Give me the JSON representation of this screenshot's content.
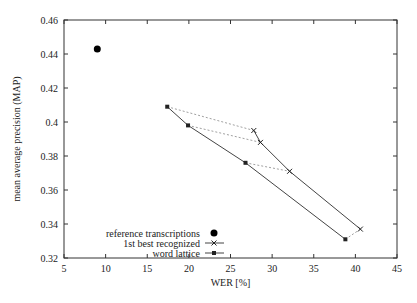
{
  "chart_data": {
    "type": "line",
    "title": "",
    "xlabel": "WER [%]",
    "ylabel": "mean average precision (MAP)",
    "xlim": [
      5,
      45
    ],
    "ylim": [
      0.32,
      0.46
    ],
    "xticks": [
      5,
      10,
      15,
      20,
      25,
      30,
      35,
      40,
      45
    ],
    "yticks": [
      0.32,
      0.34,
      0.36,
      0.38,
      0.4,
      0.42,
      0.44,
      0.46
    ],
    "ytick_labels": [
      "0.32",
      "0.34",
      "0.36",
      "0.38",
      "0.4",
      "0.42",
      "0.44",
      "0.46"
    ],
    "grid": false,
    "legend_position": "lower-left inside plot",
    "series": [
      {
        "name": "reference transcriptions",
        "marker": "filled-circle",
        "line": "none",
        "points": [
          [
            9.0,
            0.443
          ]
        ]
      },
      {
        "name": "1st best recognized",
        "marker": "x",
        "line": "solid",
        "points": [
          [
            27.8,
            0.395
          ],
          [
            28.6,
            0.388
          ],
          [
            32.1,
            0.371
          ],
          [
            40.6,
            0.337
          ]
        ]
      },
      {
        "name": "word lattice",
        "marker": "filled-square",
        "line": "solid",
        "points": [
          [
            17.4,
            0.409
          ],
          [
            19.9,
            0.398
          ],
          [
            26.8,
            0.376
          ],
          [
            38.8,
            0.331
          ]
        ]
      }
    ],
    "annotations": [
      {
        "type": "dotted-connectors",
        "description": "dotted lines pair each word lattice point with the corresponding 1st best recognized point",
        "pairs": [
          [
            [
              17.4,
              0.409
            ],
            [
              27.8,
              0.395
            ]
          ],
          [
            [
              19.9,
              0.398
            ],
            [
              28.6,
              0.388
            ]
          ],
          [
            [
              26.8,
              0.376
            ],
            [
              32.1,
              0.371
            ]
          ],
          [
            [
              38.8,
              0.331
            ],
            [
              40.6,
              0.337
            ]
          ]
        ]
      }
    ]
  },
  "legend": {
    "items": [
      "reference transcriptions",
      "1st best recognized",
      "word lattice"
    ]
  }
}
